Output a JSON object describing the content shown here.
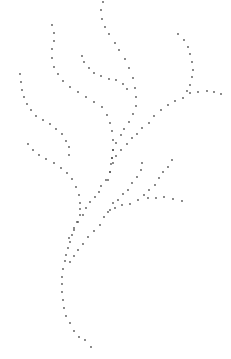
{
  "image": {
    "description": "Dotted line drawing of a branching plant stem",
    "width": 231,
    "height": 359,
    "background": "#ffffff",
    "dot_color": "#555555",
    "dot_radius": 0.9
  },
  "strokes": [
    {
      "name": "top-branch",
      "points": [
        [
          103,
          2
        ],
        [
          101,
          10
        ],
        [
          102,
          19
        ],
        [
          105,
          27
        ],
        [
          109,
          34
        ],
        [
          115,
          43
        ],
        [
          119,
          50
        ],
        [
          125,
          59
        ],
        [
          129,
          68
        ],
        [
          133,
          78
        ],
        [
          135,
          88
        ],
        [
          136,
          97
        ],
        [
          136,
          106
        ],
        [
          133,
          114
        ],
        [
          129,
          122
        ],
        [
          124,
          129
        ],
        [
          121,
          135
        ],
        [
          116,
          143
        ],
        [
          113,
          150
        ],
        [
          112,
          158
        ]
      ]
    },
    {
      "name": "left-middle-branch",
      "points": [
        [
          52,
          25
        ],
        [
          54,
          33
        ],
        [
          54,
          41
        ],
        [
          52,
          49
        ],
        [
          52,
          58
        ],
        [
          54,
          67
        ],
        [
          58,
          74
        ],
        [
          63,
          81
        ],
        [
          70,
          87
        ],
        [
          78,
          92
        ],
        [
          86,
          97
        ],
        [
          94,
          102
        ],
        [
          102,
          107
        ],
        [
          107,
          115
        ],
        [
          110,
          123
        ],
        [
          112,
          131
        ],
        [
          113,
          140
        ],
        [
          113,
          150
        ],
        [
          112,
          158
        ],
        [
          111,
          164
        ],
        [
          110,
          172
        ],
        [
          108,
          180
        ]
      ]
    },
    {
      "name": "inner-branch",
      "points": [
        [
          82,
          56
        ],
        [
          84,
          62
        ],
        [
          89,
          68
        ],
        [
          94,
          73
        ],
        [
          101,
          76
        ],
        [
          109,
          79
        ],
        [
          116,
          80
        ],
        [
          123,
          84
        ],
        [
          127,
          89
        ]
      ]
    },
    {
      "name": "right-branch",
      "points": [
        [
          178,
          34
        ],
        [
          184,
          40
        ],
        [
          188,
          47
        ],
        [
          190,
          54
        ],
        [
          192,
          62
        ],
        [
          193,
          70
        ],
        [
          192,
          77
        ],
        [
          190,
          85
        ],
        [
          187,
          91
        ],
        [
          183,
          98
        ],
        [
          175,
          101
        ],
        [
          168,
          105
        ],
        [
          161,
          110
        ],
        [
          154,
          116
        ],
        [
          149,
          123
        ],
        [
          142,
          128
        ],
        [
          137,
          134
        ],
        [
          132,
          138
        ],
        [
          127,
          144
        ],
        [
          121,
          150
        ],
        [
          116,
          156
        ],
        [
          113,
          163
        ]
      ]
    },
    {
      "name": "right-spur",
      "points": [
        [
          190,
          93
        ],
        [
          198,
          92
        ],
        [
          207,
          91
        ],
        [
          214,
          92
        ],
        [
          221,
          94
        ]
      ]
    },
    {
      "name": "far-left-branch",
      "points": [
        [
          20,
          74
        ],
        [
          21,
          82
        ],
        [
          22,
          90
        ],
        [
          24,
          97
        ],
        [
          27,
          104
        ],
        [
          31,
          110
        ],
        [
          36,
          116
        ],
        [
          43,
          120
        ],
        [
          50,
          124
        ],
        [
          56,
          129
        ],
        [
          62,
          134
        ],
        [
          66,
          141
        ],
        [
          69,
          147
        ],
        [
          69,
          155
        ]
      ]
    },
    {
      "name": "lower-left-branch",
      "points": [
        [
          28,
          144
        ],
        [
          33,
          150
        ],
        [
          39,
          155
        ],
        [
          46,
          159
        ],
        [
          54,
          163
        ],
        [
          61,
          168
        ],
        [
          67,
          173
        ],
        [
          72,
          179
        ],
        [
          76,
          187
        ],
        [
          79,
          195
        ],
        [
          80,
          203
        ],
        [
          80,
          209
        ],
        [
          80,
          215
        ],
        [
          77,
          222
        ],
        [
          74,
          228
        ],
        [
          72,
          235
        ],
        [
          70,
          242
        ],
        [
          68,
          248
        ],
        [
          66,
          255
        ],
        [
          65,
          261
        ],
        [
          63,
          269
        ],
        [
          62,
          277
        ],
        [
          62,
          284
        ],
        [
          62,
          292
        ],
        [
          63,
          300
        ],
        [
          64,
          308
        ],
        [
          66,
          316
        ],
        [
          70,
          323
        ],
        [
          74,
          331
        ],
        [
          79,
          337
        ],
        [
          85,
          340
        ],
        [
          91,
          347
        ]
      ]
    },
    {
      "name": "main-stem-right",
      "points": [
        [
          110,
          172
        ],
        [
          106,
          180
        ],
        [
          101,
          186
        ],
        [
          99,
          192
        ],
        [
          95,
          197
        ],
        [
          90,
          202
        ],
        [
          86,
          208
        ],
        [
          83,
          215
        ],
        [
          78,
          222
        ],
        [
          74,
          230
        ],
        [
          69,
          238
        ]
      ]
    },
    {
      "name": "lower-right-branch-a",
      "points": [
        [
          142,
          163
        ],
        [
          141,
          170
        ],
        [
          137,
          177
        ],
        [
          132,
          183
        ],
        [
          128,
          190
        ],
        [
          123,
          194
        ],
        [
          118,
          200
        ],
        [
          113,
          203
        ],
        [
          110,
          210
        ],
        [
          104,
          217
        ],
        [
          100,
          225
        ],
        [
          94,
          231
        ],
        [
          88,
          237
        ],
        [
          83,
          244
        ],
        [
          78,
          250
        ],
        [
          74,
          256
        ],
        [
          70,
          262
        ]
      ]
    },
    {
      "name": "lower-right-branch-b",
      "points": [
        [
          172,
          160
        ],
        [
          168,
          167
        ],
        [
          163,
          172
        ],
        [
          159,
          178
        ],
        [
          155,
          185
        ],
        [
          149,
          190
        ],
        [
          144,
          195
        ],
        [
          138,
          200
        ],
        [
          130,
          204
        ],
        [
          122,
          205
        ],
        [
          115,
          208
        ],
        [
          108,
          212
        ]
      ]
    },
    {
      "name": "lower-right-spur",
      "points": [
        [
          148,
          198
        ],
        [
          156,
          198
        ],
        [
          164,
          197
        ],
        [
          173,
          199
        ],
        [
          182,
          201
        ]
      ]
    }
  ]
}
